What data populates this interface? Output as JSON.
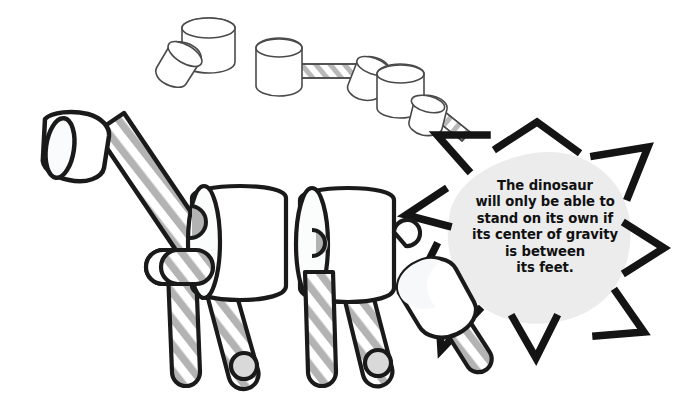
{
  "illustration": {
    "title": "Marshmallow and straw dinosaur construction illustration",
    "background_color": "#ffffff"
  },
  "callout": {
    "name": "science-fact-callout",
    "shape": "starburst",
    "blob_color": "#ececed",
    "ray_color": "#141414",
    "text_color": "#111111",
    "ray_count": 9,
    "lines": [
      "The dinosaur",
      "will only be able to",
      "stand on its own if",
      "its center of gravity",
      "is between",
      "its feet."
    ],
    "full_text": "The dinosaur will only be able to stand on its own if its center of gravity is between its feet."
  },
  "palette": {
    "outline_dark": "#1a1a1a",
    "outline_light": "#4a4a4a",
    "marshmallow_fill": "#ffffff",
    "marshmallow_shade": "#f4f5f6",
    "straw_stripe": "#b3b3b3",
    "straw_stripe_light": "#c9c9c9",
    "foot_fill": "#d9d9d9",
    "blob_gray": "#ececed"
  },
  "parts": {
    "dinosaur": {
      "name": "marshmallow-dinosaur",
      "head": "marshmallow-head-cylinder",
      "neck": "striped-straw-neck",
      "body_segments": [
        "body-marshmallow-front",
        "body-marshmallow-rear"
      ],
      "front_arm": "small-marshmallow-arm",
      "legs": [
        "leg-front-left",
        "leg-front-right",
        "leg-rear-left",
        "leg-rear-right"
      ],
      "tail": "marshmallow-tail-with-straw"
    },
    "top_pieces": [
      {
        "name": "loose-marshmallow-pair",
        "items": [
          "marshmallow-upright",
          "marshmallow-tilted"
        ]
      },
      {
        "name": "marshmallow-straw-marshmallow-assembly",
        "items": [
          "marshmallow-left",
          "striped-straw-horizontal",
          "marshmallow-right-tilted"
        ]
      },
      {
        "name": "marshmallow-straw-angled-assembly",
        "items": [
          "marshmallow-large",
          "marshmallow-small",
          "striped-straw-angled"
        ]
      }
    ]
  }
}
